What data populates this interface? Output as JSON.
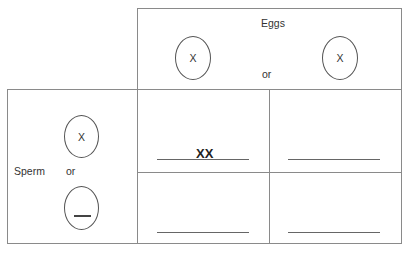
{
  "header": {
    "title": "Eggs",
    "or_label": "or"
  },
  "eggs": [
    {
      "allele": "X"
    },
    {
      "allele": "X"
    }
  ],
  "side": {
    "title": "Sperm",
    "or_label": "or"
  },
  "sperm": [
    {
      "allele": "X"
    },
    {
      "allele": ""
    }
  ],
  "grid": {
    "cells": [
      {
        "row": 0,
        "col": 0,
        "answer": "XX"
      },
      {
        "row": 0,
        "col": 1,
        "answer": ""
      },
      {
        "row": 1,
        "col": 0,
        "answer": ""
      },
      {
        "row": 1,
        "col": 1,
        "answer": ""
      }
    ]
  }
}
